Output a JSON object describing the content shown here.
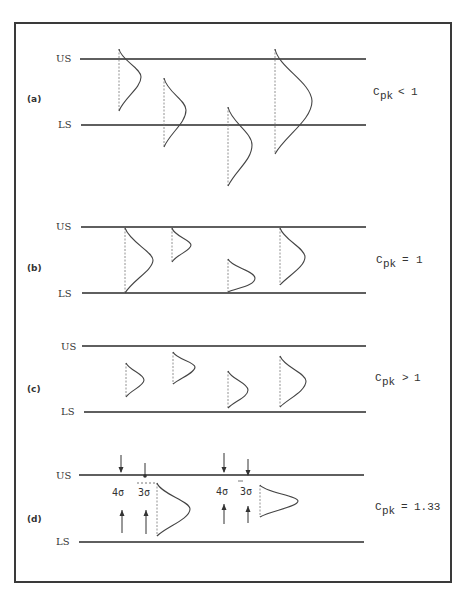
{
  "figure": {
    "panels": [
      {
        "id": "a",
        "label": "(a)",
        "upper_spec_label": "US",
        "lower_spec_label": "LS",
        "cpk_symbol": "C",
        "cpk_subscript": "pk",
        "cpk_relation": "<",
        "cpk_value": "1",
        "description": "Distributions extend beyond spec limits"
      },
      {
        "id": "b",
        "label": "(b)",
        "upper_spec_label": "US",
        "lower_spec_label": "LS",
        "cpk_symbol": "C",
        "cpk_subscript": "pk",
        "cpk_relation": "=",
        "cpk_value": "1",
        "description": "Distributions touch spec limits"
      },
      {
        "id": "c",
        "label": "(c)",
        "upper_spec_label": "US",
        "lower_spec_label": "LS",
        "cpk_symbol": "C",
        "cpk_subscript": "pk",
        "cpk_relation": ">",
        "cpk_value": "1",
        "description": "Distributions inside spec limits"
      },
      {
        "id": "d",
        "label": "(d)",
        "upper_spec_label": "US",
        "lower_spec_label": "LS",
        "cpk_symbol": "C",
        "cpk_subscript": "pk",
        "cpk_relation": "=",
        "cpk_value": "1.33",
        "sigma_labels": [
          "4σ",
          "3σ",
          "4σ",
          "3σ"
        ],
        "description": "Distributions with 4 sigma margin to spec limit"
      }
    ]
  },
  "colors": {
    "line": "#2a2a2a",
    "text": "#333333",
    "background": "#ffffff"
  }
}
